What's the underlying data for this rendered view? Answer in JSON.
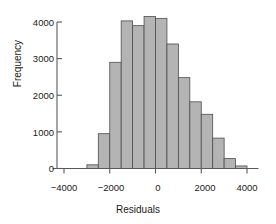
{
  "chart_data": {
    "type": "bar",
    "title": "",
    "subtitle": "",
    "xlabel": "Residuals",
    "ylabel": "Frequency",
    "grid": false,
    "legend": null,
    "bin_width": 500,
    "xlim": [
      -4500,
      4500
    ],
    "ylim": [
      0,
      4300
    ],
    "xticks": [
      -4000,
      -2000,
      0,
      2000,
      4000
    ],
    "xtick_labels": [
      "−4000",
      "−2000",
      "0",
      "2000",
      "4000"
    ],
    "yticks": [
      0,
      1000,
      2000,
      3000,
      4000
    ],
    "ytick_labels": [
      "0",
      "1000",
      "2000",
      "3000",
      "4000"
    ],
    "bin_edges": [
      -3000,
      -2500,
      -2000,
      -1500,
      -1000,
      -500,
      0,
      500,
      1000,
      1500,
      2000,
      2500,
      3000,
      3500,
      4000
    ],
    "bin_centers": [
      -2750,
      -2250,
      -1750,
      -1250,
      -750,
      -250,
      250,
      750,
      1250,
      1750,
      2250,
      2750,
      3250,
      3750
    ],
    "values": [
      100,
      950,
      2900,
      4030,
      3900,
      4150,
      4100,
      3400,
      2480,
      1820,
      1480,
      830,
      270,
      70
    ],
    "bar_color": "#b4b4b4",
    "bar_edge_color": "#4d4d4d",
    "axis_color": "#5a5a5a",
    "text_color": "#1a1a1a",
    "background_color": "#ffffff"
  },
  "axes": {
    "x_title": "Residuals",
    "y_title": "Frequency"
  }
}
